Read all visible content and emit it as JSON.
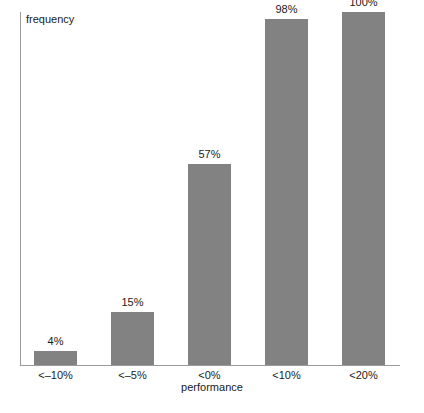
{
  "chart_data": {
    "type": "bar",
    "title": "",
    "xlabel": "performance",
    "ylabel": "frequency",
    "categories": [
      "<–10%",
      "<–5%",
      "<0%",
      "<10%",
      "<20%"
    ],
    "values": [
      4,
      15,
      57,
      98,
      100
    ],
    "value_labels": [
      "4%",
      "15%",
      "57%",
      "98%",
      "100%"
    ],
    "ylim": [
      0,
      100
    ],
    "xlim": null,
    "grid": false,
    "legend": null,
    "bar_color": "#828282",
    "axis_color": "#9a9a9a",
    "text_color": "#1a1a1a",
    "annotations": []
  }
}
